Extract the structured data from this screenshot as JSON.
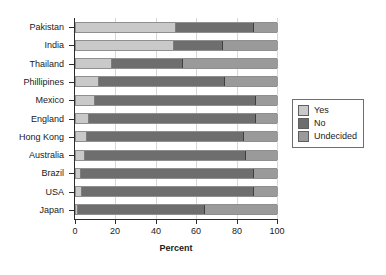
{
  "chart_data": {
    "type": "bar",
    "orientation": "horizontal",
    "stacked": true,
    "title": "",
    "xlabel": "Percent",
    "ylabel": "",
    "xlim": [
      0,
      100
    ],
    "xticks": [
      0,
      20,
      40,
      60,
      80,
      100
    ],
    "grid": true,
    "legend_position": "right",
    "categories": [
      "Pakistan",
      "India",
      "Thailand",
      "Phillipines",
      "Mexico",
      "England",
      "Hong Kong",
      "Australia",
      "Brazil",
      "USA",
      "Japan"
    ],
    "series": [
      {
        "name": "Yes",
        "color": "#c9c9c9",
        "values": [
          49.5,
          48.5,
          18,
          11.5,
          9.5,
          6.5,
          5.5,
          4.5,
          2.5,
          3,
          1
        ]
      },
      {
        "name": "No",
        "color": "#6e6e6e",
        "values": [
          38.5,
          24.5,
          35,
          62.5,
          79.5,
          82.5,
          77.5,
          79.5,
          85.5,
          85,
          63
        ]
      },
      {
        "name": "Undecided",
        "color": "#9a9a9a",
        "values": [
          12,
          27,
          47,
          26,
          11,
          11,
          17,
          16,
          12,
          12,
          36
        ]
      }
    ]
  },
  "legend": {
    "items": [
      {
        "label": "Yes",
        "swatch": "#c9c9c9"
      },
      {
        "label": "No",
        "swatch": "#6e6e6e"
      },
      {
        "label": "Undecided",
        "swatch": "#9a9a9a"
      }
    ]
  },
  "colors": {
    "axis": "#2b2b2b",
    "grid": "#d8d8d8",
    "text": "#1a1a1a",
    "background": "#ffffff"
  }
}
